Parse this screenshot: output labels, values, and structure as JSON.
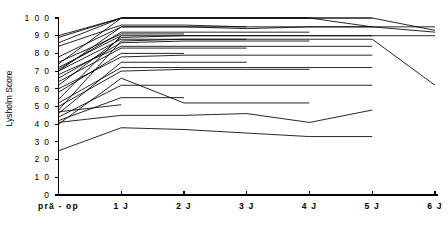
{
  "chart_data": {
    "type": "line",
    "title": "",
    "subtitle": "",
    "xlabel": "",
    "ylabel": "Lysholm Score",
    "ylim": [
      0,
      100
    ],
    "ytick_values": [
      0,
      10,
      20,
      30,
      40,
      50,
      60,
      70,
      80,
      90,
      100
    ],
    "ytick_labels": [
      "0",
      "1 0",
      "2 0",
      "3 0",
      "4 0",
      "5 0",
      "6 0",
      "7 0",
      "8 0",
      "9 0",
      "1 0 0"
    ],
    "x": [
      0,
      1,
      2,
      3,
      4,
      5,
      6
    ],
    "categories": [
      "prä - op",
      "1 J",
      "2 J",
      "3 J",
      "4 J",
      "5 J",
      "6 J"
    ],
    "grid": false,
    "legend": false,
    "legend_position": "none",
    "line_color": "#000000",
    "axis_color": "#000000",
    "background_color": "#ffffff",
    "series_count": 28,
    "series": [
      {
        "name": "patient-01",
        "x": [
          0,
          1,
          2,
          3,
          4,
          5,
          6
        ],
        "values": [
          90,
          100,
          100,
          100,
          100,
          95,
          95
        ]
      },
      {
        "name": "patient-02",
        "x": [
          0,
          1,
          2,
          3,
          4,
          5,
          6
        ],
        "values": [
          74,
          100,
          100,
          100,
          100,
          100,
          93
        ]
      },
      {
        "name": "patient-03",
        "x": [
          0,
          1,
          2,
          3,
          4,
          5,
          6
        ],
        "values": [
          70,
          95,
          95,
          94,
          95,
          95,
          92
        ]
      },
      {
        "name": "patient-04",
        "x": [
          0,
          1,
          2,
          3,
          4,
          5,
          6
        ],
        "values": [
          62,
          89,
          90,
          90,
          90,
          90,
          90
        ]
      },
      {
        "name": "patient-05",
        "x": [
          0,
          1,
          2,
          3,
          4,
          5,
          6
        ],
        "values": [
          48,
          87,
          88,
          88,
          88,
          88,
          62
        ]
      },
      {
        "name": "patient-06",
        "x": [
          0,
          1,
          2,
          3,
          4,
          5
        ],
        "values": [
          89,
          100,
          100,
          100,
          100,
          100
        ]
      },
      {
        "name": "patient-07",
        "x": [
          0,
          1,
          2,
          3,
          4,
          5
        ],
        "values": [
          84,
          96,
          96,
          95,
          95,
          95
        ]
      },
      {
        "name": "patient-08",
        "x": [
          0,
          1,
          2,
          3,
          4,
          5
        ],
        "values": [
          72,
          90,
          90,
          90,
          90,
          90
        ]
      },
      {
        "name": "patient-09",
        "x": [
          0,
          1,
          2,
          3,
          4,
          5
        ],
        "values": [
          68,
          84,
          84,
          84,
          84,
          84
        ]
      },
      {
        "name": "patient-10",
        "x": [
          0,
          1,
          2,
          3,
          4,
          5
        ],
        "values": [
          60,
          78,
          79,
          79,
          79,
          79
        ]
      },
      {
        "name": "patient-11",
        "x": [
          0,
          1,
          2,
          3,
          4,
          5
        ],
        "values": [
          52,
          72,
          72,
          72,
          72,
          72
        ]
      },
      {
        "name": "patient-12",
        "x": [
          0,
          1,
          2,
          3,
          4,
          5
        ],
        "values": [
          44,
          62,
          62,
          62,
          62,
          62
        ]
      },
      {
        "name": "patient-13",
        "x": [
          0,
          1,
          2,
          3,
          4,
          5
        ],
        "values": [
          41,
          45,
          45,
          46,
          41,
          48
        ]
      },
      {
        "name": "patient-14",
        "x": [
          0,
          1,
          2,
          3,
          4,
          5
        ],
        "values": [
          25,
          38,
          37,
          35,
          33,
          33
        ]
      },
      {
        "name": "patient-15",
        "x": [
          0,
          1,
          2,
          3,
          4
        ],
        "values": [
          86,
          100,
          100,
          100,
          100
        ]
      },
      {
        "name": "patient-16",
        "x": [
          0,
          1,
          2,
          3,
          4
        ],
        "values": [
          71,
          92,
          92,
          92,
          92
        ]
      },
      {
        "name": "patient-17",
        "x": [
          0,
          1,
          2,
          3,
          4
        ],
        "values": [
          66,
          86,
          87,
          87,
          87
        ]
      },
      {
        "name": "patient-18",
        "x": [
          0,
          1,
          2,
          3,
          4
        ],
        "values": [
          50,
          70,
          71,
          71,
          71
        ]
      },
      {
        "name": "patient-19",
        "x": [
          0,
          1,
          2,
          3,
          4
        ],
        "values": [
          40,
          66,
          52,
          52,
          52
        ]
      },
      {
        "name": "patient-20",
        "x": [
          0,
          1,
          2,
          3
        ],
        "values": [
          78,
          95,
          95,
          95
        ]
      },
      {
        "name": "patient-21",
        "x": [
          0,
          1,
          2,
          3
        ],
        "values": [
          70,
          88,
          88,
          88
        ]
      },
      {
        "name": "patient-22",
        "x": [
          0,
          1,
          2,
          3
        ],
        "values": [
          64,
          83,
          83,
          83
        ]
      },
      {
        "name": "patient-23",
        "x": [
          0,
          1,
          2,
          3
        ],
        "values": [
          46,
          75,
          75,
          75
        ]
      },
      {
        "name": "patient-24",
        "x": [
          0,
          1,
          2
        ],
        "values": [
          75,
          91,
          91
        ]
      },
      {
        "name": "patient-25",
        "x": [
          0,
          1,
          2
        ],
        "values": [
          58,
          80,
          80
        ]
      },
      {
        "name": "patient-26",
        "x": [
          0,
          1,
          2
        ],
        "values": [
          42,
          55,
          55
        ]
      },
      {
        "name": "patient-27",
        "x": [
          0,
          1
        ],
        "values": [
          54,
          90
        ]
      },
      {
        "name": "patient-28",
        "x": [
          0,
          1
        ],
        "values": [
          47,
          51
        ]
      }
    ]
  }
}
